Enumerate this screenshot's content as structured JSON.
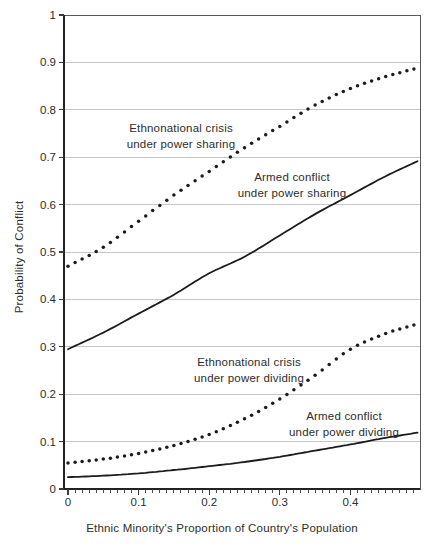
{
  "figure": {
    "width": 430,
    "height": 544,
    "background": "#ffffff",
    "colors": {
      "curve": "#1c1c1c",
      "grid": "#c6c6c6",
      "frame": "#595959",
      "axis": "#222222",
      "tick": "#3a3a3a",
      "text": "#2d2d2d"
    }
  },
  "chart_data": {
    "type": "line",
    "title": "",
    "xlabel": "Ethnic Minority's Proportion of Country's Population",
    "ylabel": "Probability of Conflict",
    "xlim": [
      0,
      0.5
    ],
    "ylim": [
      0,
      1
    ],
    "x_ticks": [
      0,
      0.1,
      0.2,
      0.3,
      0.4
    ],
    "x_tick_labels": [
      "0",
      "0.1",
      "0.2",
      "0.3",
      "0.4"
    ],
    "x_minor_step": 0.01,
    "y_ticks": [
      0,
      0.1,
      0.2,
      0.3,
      0.4,
      0.5,
      0.6,
      0.7,
      0.8,
      0.9,
      1
    ],
    "y_tick_labels": [
      "0",
      "0.1",
      "0.2",
      "0.3",
      "0.4",
      "0.5",
      "0.6",
      "0.7",
      "0.8",
      "0.9",
      "1"
    ],
    "grid": "horizontal-only",
    "legend": "inline-labels",
    "x": [
      0,
      0.05,
      0.1,
      0.15,
      0.2,
      0.25,
      0.3,
      0.35,
      0.4,
      0.45,
      0.5
    ],
    "series": [
      {
        "name": "Ethnonational crisis under power sharing",
        "style": "dotted",
        "label_line1": "Ethnonational crisis",
        "label_line2": "under power sharing",
        "values": [
          0.47,
          0.51,
          0.565,
          0.62,
          0.67,
          0.72,
          0.765,
          0.81,
          0.845,
          0.87,
          0.89
        ]
      },
      {
        "name": "Armed conflict under power sharing",
        "style": "solid",
        "label_line1": "Armed conflict",
        "label_line2": "under power sharing",
        "values": [
          0.295,
          0.33,
          0.37,
          0.41,
          0.455,
          0.49,
          0.535,
          0.58,
          0.62,
          0.66,
          0.695
        ]
      },
      {
        "name": "Ethnonational crisis under power dividing",
        "style": "dotted",
        "label_line1": "Ethnonational crisis",
        "label_line2": "under power dividing",
        "values": [
          0.055,
          0.063,
          0.075,
          0.092,
          0.115,
          0.148,
          0.19,
          0.24,
          0.295,
          0.328,
          0.35
        ]
      },
      {
        "name": "Armed conflict under power dividing",
        "style": "solid",
        "label_line1": "Armed conflict",
        "label_line2": "under power dividing",
        "values": [
          0.025,
          0.028,
          0.033,
          0.04,
          0.048,
          0.057,
          0.068,
          0.081,
          0.094,
          0.108,
          0.12
        ]
      }
    ],
    "label_positions_px": [
      {
        "x": 181,
        "y": 136
      },
      {
        "x": 292,
        "y": 185
      },
      {
        "x": 249,
        "y": 370
      },
      {
        "x": 344,
        "y": 424
      }
    ],
    "axis_title_positions_px": {
      "y": {
        "x": 19,
        "y": 257
      },
      "x": {
        "x": 222,
        "y": 522
      }
    }
  }
}
